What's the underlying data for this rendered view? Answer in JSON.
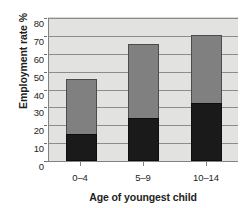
{
  "chart_data": {
    "type": "bar",
    "stacked": true,
    "title": "",
    "xlabel": "Age of youngest child",
    "ylabel": "Employment rate %",
    "categories": [
      "0–4",
      "5–9",
      "10–14"
    ],
    "ylim": [
      0,
      80
    ],
    "yticks": [
      0,
      10,
      20,
      30,
      40,
      50,
      60,
      70,
      80
    ],
    "ytick_labels": [
      "0",
      "10",
      "20",
      "30",
      "40",
      "50",
      "60",
      "70",
      "80"
    ],
    "grid": true,
    "legend": "none",
    "series": [
      {
        "name": "lower-segment",
        "color": "#1a1a1a",
        "values": [
          15,
          24,
          32.5
        ]
      },
      {
        "name": "upper-segment",
        "color": "#808080",
        "values": [
          31,
          41.5,
          38
        ]
      }
    ],
    "totals": [
      46,
      65.5,
      70.5
    ],
    "plot_background": "#e2e2e0",
    "gridline_color": "#8a8c8e",
    "axis_color": "#808285"
  }
}
